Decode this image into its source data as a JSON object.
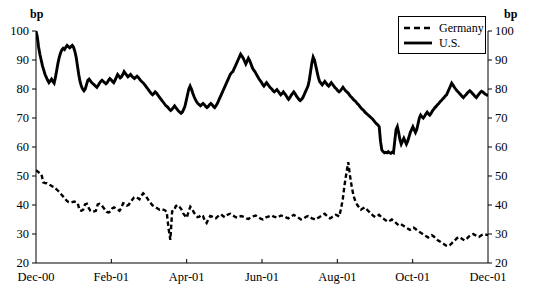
{
  "chart_data": {
    "type": "line",
    "title": "",
    "subtitle": "",
    "xlabel": "",
    "ylabel": "bp",
    "ylabel_right": "bp",
    "ylim": [
      20,
      100
    ],
    "yticks": [
      20,
      30,
      40,
      50,
      60,
      70,
      80,
      90,
      100
    ],
    "grid": false,
    "legend_position": "top-right",
    "xticks": [
      "Dec-00",
      "Feb-01",
      "Apr-01",
      "Jun-01",
      "Aug-01",
      "Oct-01",
      "Dec-01"
    ],
    "x_range": [
      "Dec-00",
      "Dec-01"
    ],
    "annotations": [],
    "series": [
      {
        "name": "Germany",
        "style": "dashed",
        "color": "#000000",
        "values": [
          52.0,
          51.5,
          51.0,
          50.6,
          47.8,
          47.6,
          47.5,
          47.2,
          46.8,
          46.4,
          46.2,
          45.6,
          45.0,
          44.4,
          43.6,
          42.9,
          42.2,
          41.4,
          41.0,
          40.8,
          41.0,
          41.2,
          41.0,
          40.6,
          38.2,
          38.0,
          38.4,
          40.2,
          40.4,
          39.0,
          38.0,
          37.6,
          37.8,
          38.0,
          40.2,
          40.4,
          40.0,
          39.2,
          38.4,
          37.6,
          37.4,
          37.8,
          38.8,
          39.2,
          38.8,
          38.4,
          38.0,
          39.0,
          40.6,
          40.4,
          39.8,
          40.0,
          41.0,
          41.8,
          42.6,
          42.8,
          42.4,
          42.0,
          43.2,
          44.0,
          43.4,
          42.6,
          41.6,
          40.8,
          40.0,
          39.6,
          39.2,
          38.8,
          38.4,
          38.6,
          38.4,
          38.2,
          37.6,
          32.0,
          28.0,
          37.8,
          38.0,
          39.6,
          40.0,
          39.4,
          38.6,
          37.2,
          36.4,
          35.6,
          37.6,
          39.4,
          38.6,
          37.4,
          36.6,
          35.8,
          36.0,
          36.6,
          36.2,
          34.6,
          33.8,
          35.2,
          36.2,
          36.0,
          35.6,
          35.4,
          36.0,
          36.4,
          36.8,
          36.2,
          35.8,
          36.4,
          36.8,
          37.0,
          36.6,
          36.2,
          35.8,
          35.6,
          36.0,
          36.2,
          36.0,
          35.8,
          35.4,
          35.2,
          35.6,
          36.0,
          36.2,
          36.4,
          36.0,
          35.6,
          35.2,
          35.0,
          35.4,
          35.8,
          36.0,
          36.2,
          36.4,
          36.0,
          35.8,
          35.6,
          36.0,
          36.4,
          36.2,
          36.0,
          35.6,
          35.4,
          35.8,
          36.2,
          36.6,
          36.2,
          35.8,
          35.4,
          35.0,
          35.2,
          35.6,
          36.0,
          36.2,
          35.8,
          35.4,
          35.2,
          35.0,
          35.4,
          35.8,
          36.2,
          36.6,
          37.0,
          36.4,
          35.8,
          35.4,
          35.8,
          36.2,
          36.6,
          36.4,
          36.0,
          38.6,
          42.0,
          47.0,
          51.0,
          54.8,
          50.0,
          46.0,
          43.0,
          41.2,
          40.0,
          39.2,
          38.4,
          38.8,
          39.2,
          38.6,
          38.0,
          37.4,
          36.8,
          36.2,
          35.8,
          36.2,
          36.6,
          36.0,
          35.4,
          35.0,
          34.6,
          34.2,
          34.6,
          35.0,
          34.6,
          34.0,
          33.4,
          33.0,
          33.4,
          33.0,
          32.6,
          32.2,
          31.8,
          31.4,
          31.8,
          32.2,
          31.8,
          31.2,
          30.8,
          30.4,
          30.0,
          29.6,
          29.2,
          28.8,
          29.2,
          29.6,
          29.2,
          28.6,
          28.0,
          27.6,
          27.2,
          26.8,
          26.4,
          26.0,
          25.8,
          26.2,
          26.8,
          27.4,
          28.0,
          28.6,
          29.0,
          28.6,
          28.2,
          27.8,
          28.2,
          28.8,
          29.4,
          29.8,
          30.0,
          29.6,
          29.2,
          29.0,
          29.4,
          29.8,
          30.0,
          29.8,
          29.6
        ]
      },
      {
        "name": "U.S.",
        "style": "solid",
        "color": "#000000",
        "values": [
          100.0,
          98.0,
          94.5,
          92.0,
          90.0,
          88.0,
          86.5,
          85.0,
          84.0,
          83.0,
          82.2,
          82.8,
          83.4,
          82.6,
          82.0,
          84.0,
          86.5,
          89.0,
          91.0,
          92.5,
          93.5,
          94.0,
          93.6,
          94.4,
          95.0,
          94.6,
          94.2,
          94.6,
          95.0,
          94.4,
          93.0,
          91.0,
          88.0,
          85.0,
          82.6,
          81.0,
          80.0,
          79.4,
          80.0,
          81.5,
          83.0,
          83.4,
          82.8,
          82.2,
          81.8,
          81.4,
          81.0,
          80.6,
          81.2,
          82.0,
          82.6,
          83.0,
          82.6,
          82.2,
          81.8,
          82.2,
          83.0,
          83.6,
          83.2,
          82.6,
          82.2,
          83.0,
          84.0,
          85.0,
          84.4,
          83.8,
          84.2,
          85.0,
          86.0,
          85.4,
          84.8,
          84.2,
          84.6,
          85.0,
          84.4,
          84.0,
          83.6,
          84.0,
          84.4,
          84.0,
          83.4,
          82.8,
          82.4,
          82.0,
          81.4,
          80.8,
          80.2,
          79.6,
          79.0,
          78.4,
          78.0,
          78.4,
          79.0,
          78.6,
          78.0,
          77.4,
          76.8,
          76.2,
          75.6,
          75.0,
          74.4,
          74.0,
          73.6,
          73.0,
          72.6,
          73.0,
          73.6,
          74.2,
          73.6,
          73.0,
          72.4,
          72.0,
          71.6,
          72.0,
          73.0,
          74.0,
          76.0,
          78.0,
          80.0,
          81.0,
          80.0,
          78.6,
          77.4,
          76.4,
          75.6,
          75.0,
          74.6,
          74.2,
          74.6,
          75.0,
          74.6,
          74.0,
          73.6,
          74.0,
          74.6,
          75.0,
          74.6,
          74.0,
          73.6,
          74.2,
          75.0,
          76.0,
          77.0,
          78.0,
          79.0,
          80.0,
          81.0,
          82.0,
          83.0,
          84.0,
          85.0,
          85.6,
          86.0,
          87.0,
          88.0,
          89.0,
          90.0,
          91.0,
          92.0,
          91.4,
          90.6,
          89.6,
          88.6,
          89.6,
          90.6,
          89.8,
          88.6,
          87.4,
          86.6,
          86.0,
          85.2,
          84.4,
          83.6,
          83.0,
          82.4,
          81.6,
          81.0,
          81.6,
          82.2,
          81.6,
          81.0,
          80.4,
          80.0,
          79.4,
          79.0,
          79.4,
          79.8,
          79.2,
          78.6,
          78.0,
          78.4,
          79.0,
          78.4,
          77.8,
          77.0,
          76.4,
          77.0,
          77.8,
          78.4,
          79.0,
          78.4,
          77.6,
          77.0,
          76.4,
          76.0,
          76.4,
          77.0,
          78.0,
          79.0,
          80.0,
          81.0,
          83.0,
          86.0,
          89.0,
          91.0,
          90.0,
          88.0,
          86.0,
          84.0,
          82.6,
          82.0,
          81.4,
          82.0,
          82.6,
          82.0,
          81.4,
          81.0,
          81.6,
          82.2,
          81.6,
          81.0,
          80.4,
          80.0,
          79.4,
          79.0,
          79.4,
          80.0,
          80.6,
          80.0,
          79.4,
          79.0,
          78.6,
          78.0,
          77.4,
          77.0,
          76.4,
          76.0,
          75.6,
          75.0,
          74.6,
          74.0,
          73.4,
          73.0,
          72.6,
          72.0,
          71.6,
          71.2,
          70.8,
          70.4,
          70.0,
          69.6,
          69.0,
          68.4,
          68.0,
          67.6,
          67.0,
          62.0,
          59.0,
          58.4,
          58.0,
          58.2,
          58.0,
          58.4,
          58.0,
          57.8,
          58.2,
          58.0,
          62.0,
          66.0,
          67.0,
          65.0,
          62.5,
          61.0,
          62.0,
          63.0,
          62.0,
          61.0,
          62.0,
          63.5,
          65.0,
          66.0,
          67.0,
          66.0,
          65.0,
          66.0,
          68.0,
          70.0,
          71.0,
          70.4,
          70.0,
          70.6,
          71.4,
          72.0,
          71.4,
          71.0,
          71.6,
          72.4,
          73.0,
          73.6,
          74.0,
          74.6,
          75.0,
          75.6,
          76.0,
          76.6,
          77.0,
          77.6,
          78.0,
          79.0,
          80.0,
          81.0,
          82.0,
          81.4,
          80.6,
          80.0,
          79.4,
          79.0,
          78.4,
          78.0,
          77.4,
          77.0,
          77.6,
          78.0,
          78.6,
          79.0,
          79.4,
          79.0,
          78.4,
          78.0,
          77.4,
          77.0,
          77.6,
          78.2,
          78.8,
          79.2,
          79.0,
          78.6,
          78.2,
          78.0,
          77.6
        ]
      }
    ]
  },
  "legend": {
    "items": [
      {
        "label": "Germany",
        "dash": "dashed"
      },
      {
        "label": "U.S.",
        "dash": "solid"
      }
    ]
  },
  "axes": {
    "left_unit": "bp",
    "right_unit": "bp"
  }
}
